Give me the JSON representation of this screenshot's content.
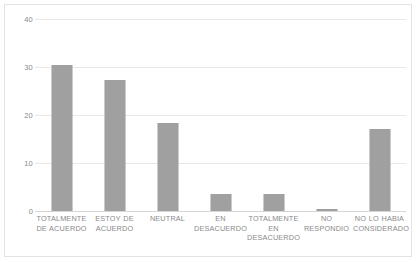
{
  "chart_data": {
    "type": "bar",
    "title": "",
    "subtitle": "",
    "xlabel": "",
    "ylabel": "",
    "ylim": [
      0,
      40
    ],
    "yticks": [
      0,
      10,
      20,
      30,
      40
    ],
    "grid": true,
    "legend": false,
    "legend_position": "none",
    "bar_color": "#8f8f8f",
    "gridline_color": "#e8e8e8",
    "axis_text_color": "#8a8a8a",
    "categories": [
      "TOTALMENTE DE ACUERDO",
      "ESTOY DE ACUERDO",
      "NEUTRAL",
      "EN DESACUERDO",
      "TOTALMENTE EN DESACUERDO",
      "NO RESPONDIO",
      "NO LO HABIA CONSIDERADO"
    ],
    "category_lines": [
      [
        "TOTALMENTE",
        "DE ACUERDO"
      ],
      [
        "ESTOY DE",
        "ACUERDO"
      ],
      [
        "NEUTRAL"
      ],
      [
        "EN",
        "DESACUERDO"
      ],
      [
        "TOTALMENTE",
        "EN",
        "DESACUERDO"
      ],
      [
        "NO RESPONDIO"
      ],
      [
        "NO LO HABIA",
        "CONSIDERADO"
      ]
    ],
    "values": [
      30.5,
      27.2,
      18.4,
      3.6,
      3.5,
      0.5,
      17.0
    ]
  }
}
